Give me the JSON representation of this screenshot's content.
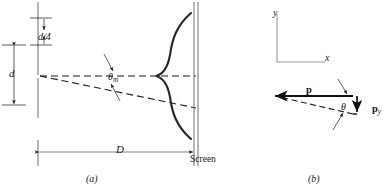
{
  "figure": {
    "panel_a": {
      "caption": "(a)",
      "labels": {
        "slit_width": "d",
        "quarter_slit": "d/4",
        "angle": "θ",
        "angle_sub": "m",
        "distance": "D",
        "screen": "Screen"
      }
    },
    "panel_b": {
      "caption": "(b)",
      "labels": {
        "axis_y": "y",
        "axis_x": "x",
        "momentum": "p",
        "angle": "θ",
        "momentum_y": "p",
        "momentum_y_sub": "y"
      }
    },
    "colors": {
      "ink": "#1a1a1a",
      "rule": "#808080",
      "curve": "#262626"
    }
  }
}
